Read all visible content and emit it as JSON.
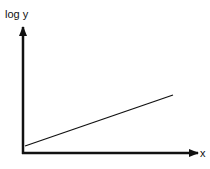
{
  "diagram": {
    "y_axis_label": "log y",
    "x_axis_label": "x",
    "line": {
      "description": "straight line rising linearly",
      "start": [
        25,
        146
      ],
      "end": [
        173,
        95
      ]
    },
    "colors": {
      "ink": "#111111",
      "background": "#ffffff"
    }
  }
}
